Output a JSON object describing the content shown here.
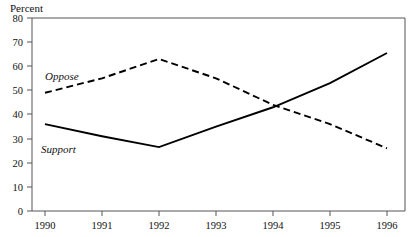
{
  "chart_data": {
    "type": "line",
    "title": "",
    "xlabel": "",
    "ylabel": "Percent",
    "ylim": [
      0,
      80
    ],
    "yticks": [
      0,
      10,
      20,
      30,
      40,
      50,
      60,
      70,
      80
    ],
    "grid": false,
    "legend_position": "inline-labels",
    "categories": [
      "1990",
      "1991",
      "1992",
      "1993",
      "1994",
      "1995",
      "1996"
    ],
    "x": [
      1990,
      1991,
      1992,
      1993,
      1994,
      1995,
      1996
    ],
    "series": [
      {
        "name": "Oppose",
        "style": "dashed",
        "color": "#000000",
        "values": [
          49,
          55,
          63,
          55,
          44,
          36,
          26
        ]
      },
      {
        "name": "Support",
        "style": "solid",
        "color": "#000000",
        "values": [
          36,
          31,
          26.5,
          35,
          43,
          53,
          65.5
        ]
      }
    ]
  },
  "axes": {
    "y_title": "Percent",
    "y_tick_labels": [
      "80",
      "70",
      "60",
      "50",
      "40",
      "30",
      "20",
      "10",
      "0"
    ],
    "x_tick_labels": [
      "1990",
      "1991",
      "1992",
      "1993",
      "1994",
      "1995",
      "1996"
    ]
  },
  "annotations": {
    "oppose_label": "Oppose",
    "support_label": "Support"
  },
  "colors": {
    "background": "#ffffff",
    "ink": "#000000",
    "frame": "#555555"
  }
}
